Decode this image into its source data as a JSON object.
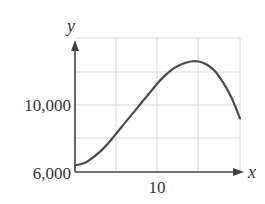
{
  "chart_data": {
    "type": "line",
    "title": "",
    "xlabel": "x",
    "ylabel": "y",
    "xlim": [
      0,
      20
    ],
    "ylim": [
      6000,
      14000
    ],
    "grid": true,
    "x_ticks": [
      0,
      5,
      10,
      15,
      20
    ],
    "y_ticks": [
      6000,
      8000,
      10000,
      12000,
      14000
    ],
    "x_tick_labels": [
      {
        "value": 10,
        "label": "10"
      }
    ],
    "y_tick_labels": [
      {
        "value": 6000,
        "label": "6,000"
      },
      {
        "value": 10000,
        "label": "10,000"
      }
    ],
    "series": [
      {
        "name": "curve",
        "x": [
          0,
          1,
          2,
          3,
          4,
          5,
          6,
          7,
          8,
          9,
          10,
          11,
          12,
          13,
          14,
          15,
          16,
          17,
          18,
          19,
          20
        ],
        "values": [
          6400,
          6500,
          6800,
          7200,
          7700,
          8300,
          8900,
          9500,
          10100,
          10700,
          11300,
          11800,
          12200,
          12450,
          12600,
          12600,
          12400,
          12000,
          11300,
          10400,
          9200
        ]
      }
    ],
    "color": "#4a4a4a"
  },
  "labels": {
    "y_axis": "y",
    "x_axis": "x",
    "y_tick_10000": "10,000",
    "y_tick_6000": "6,000",
    "x_tick_10": "10"
  }
}
